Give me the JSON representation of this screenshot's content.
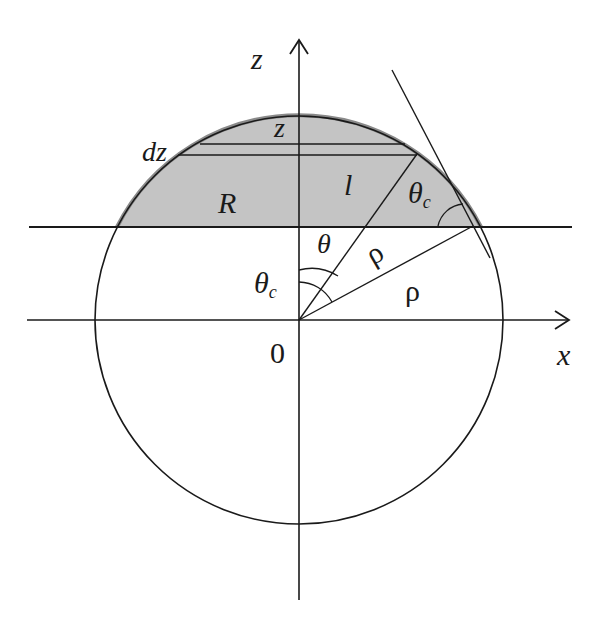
{
  "diagram": {
    "colors": {
      "stroke": "#1a1a1a",
      "cap_fill": "#c4c4c4",
      "cap_edge": "#8a8a8a",
      "background": "#ffffff"
    },
    "geometry": {
      "circle_center": [
        299,
        320
      ],
      "radius": 204,
      "cap_base_y": 227,
      "slice_upper_y": 144,
      "slice_lower_y": 155
    },
    "labels": {
      "z_axis": "z",
      "x_axis": "x",
      "origin": "0",
      "slice_z": "z",
      "dz": "dz",
      "R": "R",
      "l": "l",
      "theta": "θ",
      "theta_c_inner": "θ",
      "theta_c_inner_sub": "c",
      "theta_c_outer": "θ",
      "theta_c_outer_sub": "c",
      "rho_1": "ρ",
      "rho_2": "ρ"
    }
  }
}
